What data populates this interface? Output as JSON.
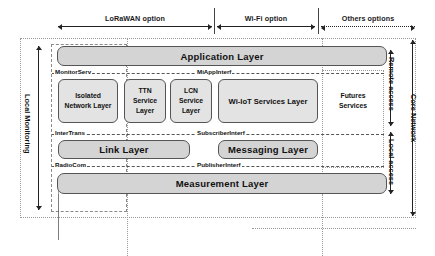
{
  "diagram": {
    "top_spans": [
      {
        "id": "lorawan",
        "label": "LoRaWAN option"
      },
      {
        "id": "wifi",
        "label": "Wi-Fi option"
      },
      {
        "id": "others",
        "label": "Others options"
      }
    ],
    "side_labels": {
      "left": "Local Monitoring",
      "right_outer": "Core Network",
      "right_remote": "Remote access",
      "right_local": "Local access"
    },
    "layers": {
      "application": "Application Layer",
      "link": "Link Layer",
      "messaging": "Messaging Layer",
      "measurement": "Measurement Layer"
    },
    "services": [
      {
        "id": "isolated-network",
        "label": "Isolated Network Layer"
      },
      {
        "id": "ttn-service",
        "label": "TTN Service Layer"
      },
      {
        "id": "lcn-service",
        "label": "LCN Service Layer"
      },
      {
        "id": "wi-iot-services",
        "label": "Wi-IoT Services Layer"
      },
      {
        "id": "futures-services",
        "label": "Futures Services"
      }
    ],
    "interfaces": [
      {
        "id": "monitorserv",
        "label": "MonitorServ"
      },
      {
        "id": "miappinterf",
        "label": "MiAppInterf"
      },
      {
        "id": "intertrans",
        "label": "InterTrans"
      },
      {
        "id": "subscriberinterf",
        "label": "SubscriberInterf"
      },
      {
        "id": "radiocom",
        "label": "RadioCom"
      },
      {
        "id": "publisherinterf",
        "label": "PublisherInterf"
      }
    ],
    "colors": {
      "layer_fill": "#d4d4d4",
      "service_fill": "#e3e3e3",
      "stroke": "#555555",
      "dashed": "#8a8a8a",
      "text": "#111111",
      "background": "#ffffff"
    }
  }
}
